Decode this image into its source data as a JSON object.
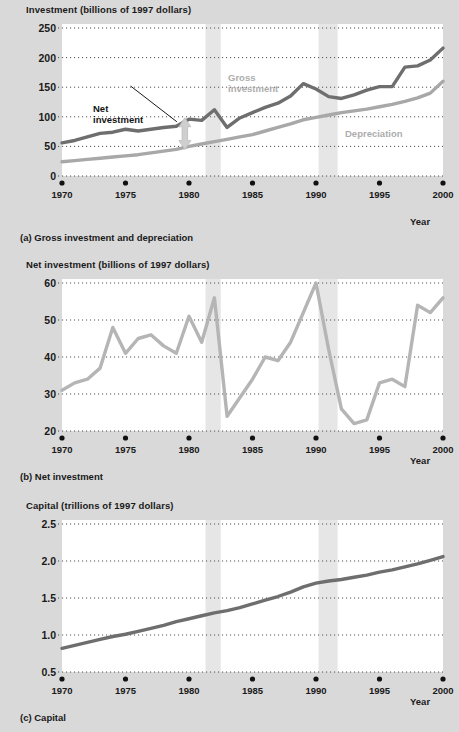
{
  "figure": {
    "background_color": "#d9d9d9",
    "plot_background_color": "#ffffff",
    "recession_band_color": "#e6e6e6",
    "gross_color": "#6e6e6e",
    "depreciation_color": "#a8a8a8",
    "net_color": "#b5b5b5",
    "capital_color": "#6e6e6e",
    "text_color": "#1a1a1a",
    "gridline_color": "#4d4d4d"
  },
  "panels": [
    {
      "id": "a",
      "axis_title": "Investment (billions of 1997 dollars)",
      "caption": "(a) Gross investment and depreciation",
      "x_axis_label": "Year",
      "annotations": [
        {
          "name": "gross-investment-label",
          "text_line1": "Gross",
          "text_line2": "investment"
        },
        {
          "name": "depreciation-label",
          "text_line1": "Depreciation",
          "text_line2": ""
        },
        {
          "name": "net-investment-label",
          "text_line1": "Net",
          "text_line2": "investment"
        }
      ]
    },
    {
      "id": "b",
      "axis_title": "Net investment (billions of 1997 dollars)",
      "caption": "(b) Net investment",
      "x_axis_label": "Year",
      "annotations": []
    },
    {
      "id": "c",
      "axis_title": "Capital (trillions of 1997 dollars)",
      "caption": "(c) Capital",
      "x_axis_label": "Year",
      "annotations": []
    }
  ],
  "chart_data": [
    {
      "type": "line",
      "panel": "a",
      "title": "Investment (billions of 1997 dollars)",
      "subtitle": "(a) Gross investment and depreciation",
      "xlabel": "Year",
      "ylabel": "Investment (billions of 1997 dollars)",
      "xlim": [
        1970,
        2000
      ],
      "ylim": [
        0,
        250
      ],
      "yticks": [
        0,
        50,
        100,
        150,
        200,
        250
      ],
      "xticks": [
        1970,
        1975,
        1980,
        1985,
        1990,
        1995,
        2000
      ],
      "grid": true,
      "legend": "inline-annotations",
      "recession_bands": [
        [
          1981.3,
          1982.5
        ],
        [
          1990.2,
          1991.7
        ]
      ],
      "x": [
        1970,
        1971,
        1972,
        1973,
        1974,
        1975,
        1976,
        1977,
        1978,
        1979,
        1980,
        1981,
        1982,
        1983,
        1984,
        1985,
        1986,
        1987,
        1988,
        1989,
        1990,
        1991,
        1992,
        1993,
        1994,
        1995,
        1996,
        1997,
        1998,
        1999,
        2000
      ],
      "series": [
        {
          "name": "Gross investment",
          "color": "#6e6e6e",
          "values": [
            56,
            60,
            66,
            72,
            74,
            79,
            76,
            79,
            82,
            84,
            96,
            94,
            112,
            82,
            98,
            107,
            116,
            123,
            135,
            156,
            147,
            134,
            131,
            137,
            145,
            151,
            151,
            184,
            186,
            196,
            216
          ]
        },
        {
          "name": "Depreciation",
          "color": "#a8a8a8",
          "values": [
            24,
            26,
            28,
            30,
            32,
            34,
            36,
            39,
            42,
            45,
            50,
            54,
            58,
            62,
            66,
            70,
            76,
            82,
            88,
            95,
            99,
            103,
            107,
            110,
            113,
            117,
            121,
            126,
            132,
            140,
            160
          ]
        }
      ]
    },
    {
      "type": "line",
      "panel": "b",
      "title": "Net investment (billions of 1997 dollars)",
      "subtitle": "(b) Net investment",
      "xlabel": "Year",
      "ylabel": "Net investment (billions of 1997 dollars)",
      "xlim": [
        1970,
        2000
      ],
      "ylim": [
        20,
        60
      ],
      "yticks": [
        20,
        30,
        40,
        50,
        60
      ],
      "xticks": [
        1970,
        1975,
        1980,
        1985,
        1990,
        1995,
        2000
      ],
      "grid": true,
      "recession_bands": [
        [
          1981.3,
          1982.5
        ],
        [
          1990.2,
          1991.7
        ]
      ],
      "x": [
        1970,
        1971,
        1972,
        1973,
        1974,
        1975,
        1976,
        1977,
        1978,
        1979,
        1980,
        1981,
        1982,
        1983,
        1984,
        1985,
        1986,
        1987,
        1988,
        1989,
        1990,
        1991,
        1992,
        1993,
        1994,
        1995,
        1996,
        1997,
        1998,
        1999,
        2000
      ],
      "series": [
        {
          "name": "Net investment",
          "color": "#b5b5b5",
          "values": [
            31,
            33,
            34,
            37,
            48,
            41,
            45,
            46,
            43,
            41,
            51,
            44,
            56,
            24,
            29,
            34,
            40,
            39,
            44,
            52,
            60,
            42,
            26,
            22,
            23,
            33,
            34,
            32,
            54,
            52,
            56
          ]
        }
      ]
    },
    {
      "type": "line",
      "panel": "c",
      "title": "Capital (trillions of 1997 dollars)",
      "subtitle": "(c) Capital",
      "xlabel": "Year",
      "ylabel": "Capital (trillions of 1997 dollars)",
      "xlim": [
        1970,
        2000
      ],
      "ylim": [
        0.5,
        2.5
      ],
      "yticks": [
        0.5,
        1.0,
        1.5,
        2.0,
        2.5
      ],
      "xticks": [
        1970,
        1975,
        1980,
        1985,
        1990,
        1995,
        2000
      ],
      "grid": true,
      "recession_bands": [
        [
          1981.3,
          1982.5
        ],
        [
          1990.2,
          1991.7
        ]
      ],
      "x": [
        1970,
        1971,
        1972,
        1973,
        1974,
        1975,
        1976,
        1977,
        1978,
        1979,
        1980,
        1981,
        1982,
        1983,
        1984,
        1985,
        1986,
        1987,
        1988,
        1989,
        1990,
        1991,
        1992,
        1993,
        1994,
        1995,
        1996,
        1997,
        1998,
        1999,
        2000
      ],
      "series": [
        {
          "name": "Capital",
          "color": "#6e6e6e",
          "values": [
            0.82,
            0.86,
            0.9,
            0.94,
            0.98,
            1.01,
            1.05,
            1.09,
            1.13,
            1.18,
            1.22,
            1.26,
            1.3,
            1.33,
            1.37,
            1.42,
            1.47,
            1.52,
            1.58,
            1.65,
            1.7,
            1.73,
            1.75,
            1.78,
            1.81,
            1.85,
            1.88,
            1.92,
            1.96,
            2.01,
            2.06
          ]
        }
      ]
    }
  ],
  "axis_tick_labels": {
    "panel_a_y": [
      "0",
      "50",
      "100",
      "150",
      "200",
      "250"
    ],
    "panel_b_y": [
      "20",
      "30",
      "40",
      "50",
      "60"
    ],
    "panel_c_y": [
      "0.5",
      "1.0",
      "1.5",
      "2.0",
      "2.5"
    ],
    "x": [
      "1970",
      "1975",
      "1980",
      "1985",
      "1990",
      "1995",
      "2000"
    ]
  }
}
